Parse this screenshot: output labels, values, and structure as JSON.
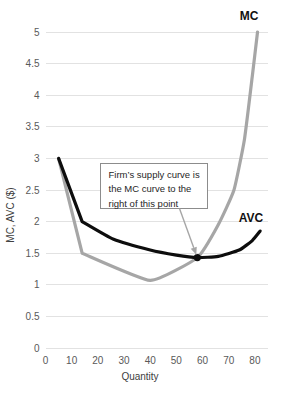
{
  "chart_data": {
    "type": "line",
    "title": "",
    "xlabel": "Quantity",
    "ylabel": "MC, AVC ($)",
    "xlim": [
      0,
      85
    ],
    "ylim": [
      0,
      5
    ],
    "grid": true,
    "legend_position": "inline-curve-labels",
    "xticks": [
      "0",
      "10",
      "20",
      "30",
      "40",
      "50",
      "60",
      "70",
      "80"
    ],
    "xtick_values": [
      0,
      10,
      20,
      30,
      40,
      50,
      60,
      70,
      80
    ],
    "yticks": [
      "0",
      "0.5",
      "1",
      "1.5",
      "2",
      "2.5",
      "3",
      "3.5",
      "4",
      "4.5",
      "5"
    ],
    "ytick_values": [
      0,
      0.5,
      1,
      1.5,
      2,
      2.5,
      3,
      3.5,
      4,
      4.5,
      5
    ],
    "series": [
      {
        "name": "MC",
        "color": "#a6a6a6",
        "label_text": "MC",
        "x": [
          5,
          14,
          40,
          58,
          66,
          72,
          76,
          79,
          81
        ],
        "values": [
          3.0,
          1.5,
          1.07,
          1.43,
          1.95,
          2.5,
          3.3,
          4.3,
          5.0
        ]
      },
      {
        "name": "AVC",
        "color": "#0d0d0d",
        "label_text": "AVC",
        "x": [
          5,
          14,
          26,
          40,
          50,
          58,
          66,
          74,
          79,
          82
        ],
        "values": [
          3.0,
          2.0,
          1.72,
          1.55,
          1.47,
          1.43,
          1.45,
          1.55,
          1.7,
          1.85
        ]
      }
    ],
    "annotations": [
      {
        "name": "supply-curve-note",
        "lines": [
          "Firm’s supply curve is",
          "the MC curve to the",
          "right of this point"
        ],
        "points_to": {
          "x": 58,
          "y": 1.43
        }
      }
    ],
    "markers": [
      {
        "name": "intersection-point",
        "x": 58,
        "y": 1.43,
        "color": "#0d0d0d"
      }
    ]
  }
}
